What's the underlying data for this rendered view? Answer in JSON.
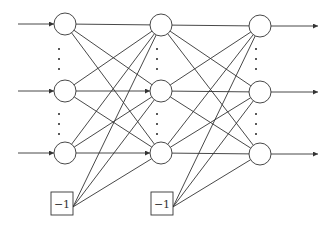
{
  "diagram": {
    "type": "feedforward-neural-network",
    "colors": {
      "stroke": "#333333",
      "background": "#ffffff",
      "dots": "#222222"
    },
    "layers": [
      {
        "id": "layer-1",
        "x": 65,
        "nodes_y": [
          24,
          91,
          153
        ]
      },
      {
        "id": "layer-2",
        "x": 161,
        "nodes_y": [
          25,
          91,
          153
        ]
      },
      {
        "id": "layer-3",
        "x": 260,
        "nodes_y": [
          26,
          92,
          154
        ]
      }
    ],
    "node_radius": 11,
    "input_arrows": {
      "start_x": 18
    },
    "output_arrows": {
      "end_x": 318
    },
    "ellipsis_rows": [
      [
        49,
        59,
        69
      ],
      [
        114,
        124,
        134
      ]
    ],
    "bias_units": [
      {
        "label": "−1",
        "x": 51,
        "y": 192,
        "w": 22,
        "h": 23,
        "feeds_layer": 1
      },
      {
        "label": "−1",
        "x": 151,
        "y": 192,
        "w": 22,
        "h": 23,
        "feeds_layer": 2
      }
    ]
  }
}
